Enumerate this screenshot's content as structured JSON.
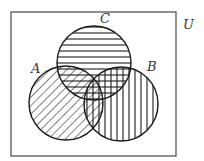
{
  "diagram": {
    "type": "venn",
    "universe": {
      "label": "U",
      "rect": {
        "x": 11,
        "y": 12,
        "w": 165,
        "h": 144
      }
    },
    "sets": [
      {
        "id": "A",
        "label": "A",
        "cx": 66,
        "cy": 103,
        "r": 37,
        "hatch": "diagonal"
      },
      {
        "id": "B",
        "label": "B",
        "cx": 121,
        "cy": 104,
        "r": 37,
        "hatch": "vertical"
      },
      {
        "id": "C",
        "label": "C",
        "cx": 94,
        "cy": 63,
        "r": 37,
        "hatch": "horizontal"
      }
    ],
    "labels": {
      "U": "U",
      "A": "A",
      "B": "B",
      "C": "C"
    },
    "colors": {
      "stroke": "#1a1a1a",
      "frame": "#555555",
      "background": "#ffffff"
    }
  }
}
